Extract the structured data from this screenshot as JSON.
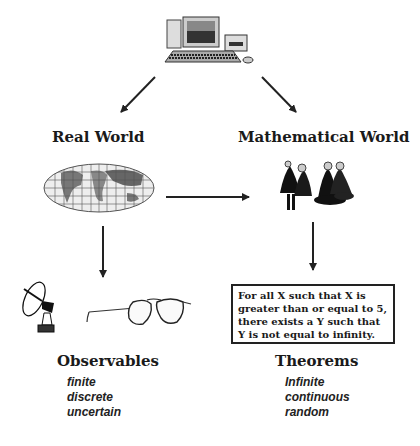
{
  "diagram": {
    "top": {
      "icon": "computer-icon"
    },
    "left": {
      "title": "Real World",
      "icon": "world-map-icon",
      "bottom_icons": [
        "satellite-dish-icon",
        "eyeglasses-icon"
      ],
      "result_title": "Observables",
      "attributes": [
        "finite",
        "discrete",
        "uncertain"
      ]
    },
    "right": {
      "title": "Mathematical World",
      "icon": "mathematicians-group-icon",
      "statement": "For all X such that X is greater than or equal to 5, there exists a Y such that Y is not equal to infinity.",
      "result_title": "Theorems",
      "attributes": [
        "Infinite",
        "continuous",
        "random"
      ]
    },
    "arrows": [
      {
        "from": "computer",
        "to": "Real World"
      },
      {
        "from": "computer",
        "to": "Mathematical World"
      },
      {
        "from": "Real World",
        "to": "Mathematical World"
      },
      {
        "from": "Real World",
        "to": "Observables"
      },
      {
        "from": "Mathematical World",
        "to": "Theorems"
      }
    ]
  }
}
